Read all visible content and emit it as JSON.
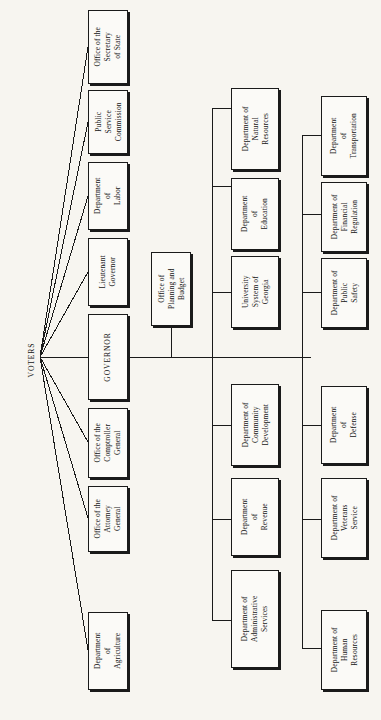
{
  "diagram": {
    "orientation": "rotated-90-ccw",
    "root": {
      "label": "VOTERS"
    },
    "colors": {
      "background": "#f7f5f0",
      "box_fill": "#fbfaf7",
      "line": "#1a1a1a",
      "text": "#141414"
    },
    "elected_offices": [
      {
        "id": "sec-state",
        "label": "Office of the\nSecretary\nof State"
      },
      {
        "id": "psc",
        "label": "Public\nService\nCommission"
      },
      {
        "id": "labor",
        "label": "Department\nof\nLabor"
      },
      {
        "id": "lt-gov",
        "label": "Lieutenant\nGovernor"
      },
      {
        "id": "governor",
        "label": "GOVERNOR"
      },
      {
        "id": "comptroller",
        "label": "Office of the\nComptroller\nGeneral"
      },
      {
        "id": "attorney",
        "label": "Office of the\nAttorney\nGeneral"
      },
      {
        "id": "agriculture",
        "label": "Department\nof\nAgriculture"
      }
    ],
    "staff_office": {
      "id": "opb",
      "label": "Office of\nPlanning and\nBudget"
    },
    "column_middle": [
      {
        "id": "dnr",
        "label": "Department of\nNatural\nResources"
      },
      {
        "id": "education",
        "label": "Department\nof\nEducation"
      },
      {
        "id": "usg",
        "label": "University\nSystem of\nGeorgia"
      },
      {
        "id": "community",
        "label": "Department of\nCommunity\nDevelopment"
      },
      {
        "id": "revenue",
        "label": "Department\nof\nRevenue"
      },
      {
        "id": "admin",
        "label": "Department of\nAdministrative\nServices"
      }
    ],
    "column_right": [
      {
        "id": "dot",
        "label": "Department\nof\nTransportation"
      },
      {
        "id": "financial",
        "label": "Department of\nFinancial\nRegulation"
      },
      {
        "id": "safety",
        "label": "Department of\nPublic\nSafety"
      },
      {
        "id": "defense",
        "label": "Department\nof\nDefense"
      },
      {
        "id": "veterans",
        "label": "Department of\nVeterans\nService"
      },
      {
        "id": "human",
        "label": "Department of\nHuman\nResources"
      }
    ]
  }
}
